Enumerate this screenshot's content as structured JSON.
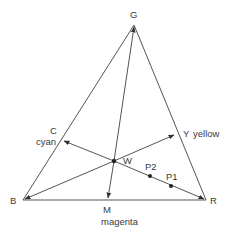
{
  "diagram": {
    "type": "color-triangle",
    "colors": {
      "line": "#555555",
      "text": "#3a3a3a",
      "point": "#222222",
      "background": "#ffffff"
    },
    "vertices": {
      "G": {
        "label": "G",
        "x": 134,
        "y": 25
      },
      "B": {
        "label": "B",
        "x": 23,
        "y": 200
      },
      "R": {
        "label": "R",
        "x": 206,
        "y": 200
      }
    },
    "white_point": {
      "label": "W",
      "x": 114,
      "y": 161
    },
    "complements": {
      "C": {
        "label": "C",
        "sublabel": "cyan",
        "x": 62,
        "y": 140
      },
      "Y": {
        "label": "Y",
        "sublabel": "yellow",
        "x": 176,
        "y": 134
      },
      "M": {
        "label": "M",
        "sublabel": "magenta",
        "x": 108,
        "y": 200
      }
    },
    "points": [
      {
        "label": "P2",
        "x": 150,
        "y": 176
      },
      {
        "label": "P1",
        "x": 171,
        "y": 186
      }
    ]
  }
}
